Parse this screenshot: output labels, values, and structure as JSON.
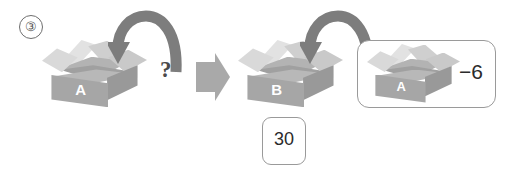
{
  "page": {
    "width": 517,
    "height": 178,
    "background": "#ffffff",
    "problem_number": "③"
  },
  "palette": {
    "box_front": "#a6a6a6",
    "box_side": "#999999",
    "box_rim": "#b8b8b8",
    "box_inner": "#b3b3b3",
    "flap_light": "#e2e2e2",
    "flap_mid": "#d9d9d9",
    "flap_dark": "#c9c9c9",
    "arrow_gray": "#7d7d7d",
    "block_arrow_gray": "#a9a9a9",
    "outline_gray": "#9a9a9a",
    "label_text": "#ffffff",
    "value_text": "#2b2b2b"
  },
  "diagram": {
    "type": "box-transfer-flow",
    "elements": [
      {
        "id": "carton-a-left",
        "kind": "open-carton",
        "label": "A"
      },
      {
        "id": "drop-arrow-left",
        "kind": "curved-down-arrow",
        "direction": "right-to-left-into-box"
      },
      {
        "id": "unknown-marker",
        "kind": "text",
        "label": "?"
      },
      {
        "id": "flow-arrow",
        "kind": "block-right-arrow",
        "direction": "right"
      },
      {
        "id": "carton-b",
        "kind": "open-carton",
        "label": "B"
      },
      {
        "id": "drop-arrow-right",
        "kind": "curved-down-arrow",
        "direction": "right-to-left-into-box"
      },
      {
        "id": "quantity-card",
        "kind": "rounded-card",
        "label": "30"
      },
      {
        "id": "result-group",
        "kind": "rounded-group",
        "contains": [
          "carton-a-right",
          "delta-value"
        ]
      },
      {
        "id": "carton-a-right",
        "kind": "open-carton",
        "label": "A"
      },
      {
        "id": "delta-value",
        "kind": "text",
        "label": "−6"
      }
    ]
  },
  "labels": {
    "carton_a_left": "A",
    "carton_b": "B",
    "carton_a_right": "A",
    "question_mark": "?",
    "quantity": "30",
    "delta": "−6"
  }
}
